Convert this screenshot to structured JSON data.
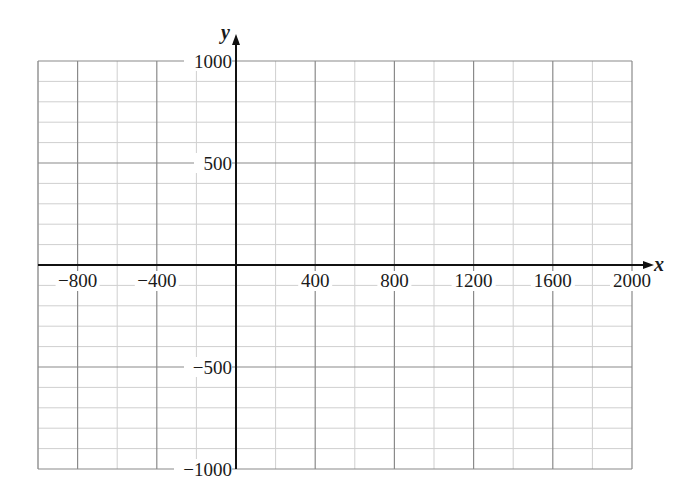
{
  "chart_data": {
    "type": "scatter",
    "title": "",
    "xlabel": "x",
    "ylabel": "y",
    "xlim": [
      -1000,
      2000
    ],
    "ylim": [
      -1000,
      1000
    ],
    "grid": true,
    "x_ticks": [
      -800,
      -400,
      400,
      800,
      1200,
      1600,
      2000
    ],
    "x_tick_labels": [
      "−800",
      "−400",
      "400",
      "800",
      "1200",
      "1600",
      "2000"
    ],
    "y_ticks": [
      1000,
      500,
      -500,
      -1000
    ],
    "y_tick_labels": [
      "1000",
      "500",
      "−500",
      "−1000"
    ],
    "x_major_step": 400,
    "x_minor_step": 200,
    "y_major_step": 500,
    "y_minor_step": 100,
    "series": [],
    "legend": null
  },
  "colors": {
    "major_grid": "#8a8a8a",
    "minor_grid": "#cfcfcf",
    "axis": "#111111",
    "text": "#1a1a1a"
  },
  "layout": {
    "px_left": 38,
    "px_right": 632,
    "px_top": 61,
    "px_bottom": 469
  }
}
